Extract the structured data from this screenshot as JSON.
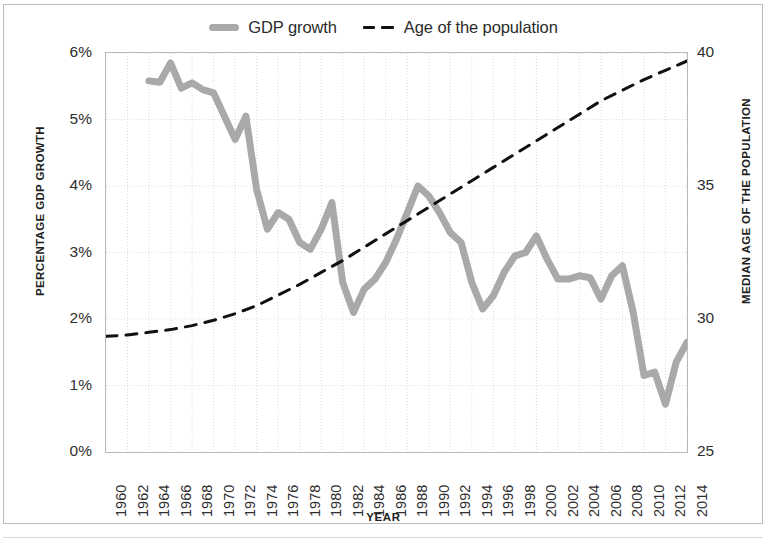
{
  "chart_data": {
    "type": "line",
    "title": "",
    "xlabel": "YEAR",
    "ylabel": "PERCENTAGE GDP GROWTH",
    "ylabel_secondary": "MEDIAN AGE OF THE POPULATION",
    "grid": true,
    "legend_position": "top",
    "xlim": [
      1960,
      2014
    ],
    "ylim": [
      0,
      6
    ],
    "ylim_secondary": [
      25,
      40
    ],
    "xticks": [
      1960,
      1962,
      1964,
      1966,
      1968,
      1970,
      1972,
      1974,
      1976,
      1978,
      1980,
      1982,
      1984,
      1986,
      1988,
      1990,
      1992,
      1994,
      1996,
      1998,
      2000,
      2002,
      2004,
      2006,
      2008,
      2010,
      2012,
      2014
    ],
    "xticklabels": [
      "1960",
      "1962",
      "1964",
      "1966",
      "1968",
      "1970",
      "1972",
      "1974",
      "1976",
      "1978",
      "1980",
      "1982",
      "1984",
      "1986",
      "1988",
      "1990",
      "1992",
      "1994",
      "1996",
      "1998",
      "2000",
      "2002",
      "2004",
      "2006",
      "2008",
      "2010",
      "2012",
      "2014"
    ],
    "yticks": [
      0,
      1,
      2,
      3,
      4,
      5,
      6
    ],
    "yticklabels": [
      "0%",
      "1%",
      "2%",
      "3%",
      "4%",
      "5%",
      "6%"
    ],
    "yticks_secondary": [
      25,
      30,
      35,
      40
    ],
    "yticklabels_secondary": [
      "25",
      "30",
      "35",
      "40"
    ],
    "series": [
      {
        "name": "GDP growth",
        "axis": "left",
        "color": "#a9a9a9",
        "style": "solid",
        "width": 7,
        "x": [
          1964,
          1965,
          1966,
          1967,
          1968,
          1969,
          1970,
          1971,
          1972,
          1973,
          1974,
          1975,
          1976,
          1977,
          1978,
          1979,
          1980,
          1981,
          1982,
          1983,
          1984,
          1985,
          1986,
          1987,
          1988,
          1989,
          1990,
          1991,
          1992,
          1993,
          1994,
          1995,
          1996,
          1997,
          1998,
          1999,
          2000,
          2001,
          2002,
          2003,
          2004,
          2005,
          2006,
          2007,
          2008,
          2009,
          2010,
          2011,
          2012,
          2013,
          2014
        ],
        "y": [
          5.58,
          5.56,
          5.85,
          5.47,
          5.55,
          5.45,
          5.4,
          5.05,
          4.7,
          5.05,
          3.95,
          3.35,
          3.6,
          3.5,
          3.15,
          3.05,
          3.35,
          3.75,
          2.55,
          2.1,
          2.45,
          2.6,
          2.85,
          3.2,
          3.6,
          4.0,
          3.85,
          3.6,
          3.3,
          3.15,
          2.55,
          2.15,
          2.35,
          2.7,
          2.95,
          3.0,
          3.25,
          2.9,
          2.6,
          2.6,
          2.65,
          2.62,
          2.3,
          2.65,
          2.8,
          2.1,
          1.15,
          1.2,
          0.72,
          1.35,
          1.65
        ]
      },
      {
        "name": "Age of the population",
        "axis": "right",
        "color": "#111111",
        "style": "dashed",
        "width": 3,
        "x": [
          1960,
          1962,
          1964,
          1966,
          1968,
          1970,
          1972,
          1974,
          1976,
          1978,
          1980,
          1982,
          1984,
          1986,
          1988,
          1990,
          1992,
          1994,
          1996,
          1998,
          2000,
          2002,
          2004,
          2006,
          2008,
          2010,
          2012,
          2014
        ],
        "y": [
          29.35,
          29.4,
          29.5,
          29.6,
          29.75,
          29.95,
          30.2,
          30.5,
          30.9,
          31.3,
          31.75,
          32.2,
          32.7,
          33.2,
          33.7,
          34.2,
          34.7,
          35.2,
          35.7,
          36.2,
          36.7,
          37.2,
          37.7,
          38.2,
          38.6,
          39.0,
          39.35,
          39.7
        ]
      }
    ]
  },
  "legend": {
    "entries": [
      {
        "label": "GDP growth",
        "swatch": "solid-gray-line-swatch"
      },
      {
        "label": "Age of the population",
        "swatch": "dashed-black-line-swatch"
      }
    ]
  }
}
